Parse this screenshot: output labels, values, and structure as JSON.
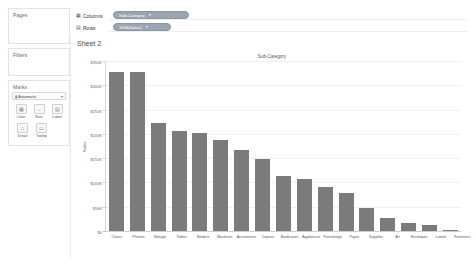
{
  "sidebar": {
    "pages": {
      "title": "Pages"
    },
    "filters": {
      "title": "Filters"
    },
    "marks": {
      "title": "Marks",
      "mark_type": {
        "label": "Automatic",
        "icon": "bar-mark-icon",
        "caret": "▾"
      },
      "buttons": [
        {
          "name": "color",
          "label": "Color",
          "glyph": "▦"
        },
        {
          "name": "size",
          "label": "Size",
          "glyph": "⇔"
        },
        {
          "name": "label",
          "label": "Label",
          "glyph": "▤"
        },
        {
          "name": "detail",
          "label": "Detail",
          "glyph": "∴"
        },
        {
          "name": "tooltip",
          "label": "Tooltip",
          "glyph": "▭"
        }
      ]
    }
  },
  "shelves": {
    "columns": {
      "label": "Columns",
      "icon": "▦",
      "pill": "Sub-Category",
      "pill_caret": "▾"
    },
    "rows": {
      "label": "Rows",
      "icon": "▤",
      "pill": "SUM(Sales)",
      "pill_caret": "▾"
    }
  },
  "worksheet": {
    "sheet_title": "Sheet 2"
  },
  "colors": {
    "bar": "#7b7b7b",
    "pill": "#9aa5b1",
    "grid": "#f0f0f0",
    "panel_border": "#e3e3e3"
  },
  "chart_data": {
    "type": "bar",
    "title": "Sub-Category",
    "xlabel": "",
    "ylabel": "Sales",
    "ylim": [
      0,
      350000
    ],
    "ytick_values": [
      0,
      50000,
      100000,
      150000,
      200000,
      250000,
      300000,
      350000
    ],
    "ytick_labels": [
      "$0",
      "$50K",
      "$100K",
      "$150K",
      "$200K",
      "$250K",
      "$300K",
      "$350K"
    ],
    "grid": true,
    "legend": "none",
    "categories": [
      "Chairs",
      "Phones",
      "Storage",
      "Tables",
      "Binders",
      "Machines",
      "Accessories",
      "Copiers",
      "Bookcases",
      "Appliances",
      "Furnishings",
      "Paper",
      "Supplies",
      "Art",
      "Envelopes",
      "Labels",
      "Fasteners"
    ],
    "values": [
      328449,
      330007,
      223844,
      206966,
      203413,
      189239,
      167380,
      149528,
      114880,
      107532,
      91705,
      78479,
      46674,
      27119,
      16476,
      12486,
      3024
    ]
  }
}
